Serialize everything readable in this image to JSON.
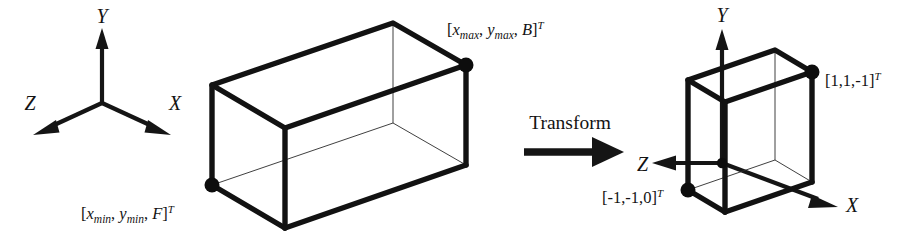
{
  "figure": {
    "colors": {
      "ink": "#121212",
      "thin_edge": "#2a2a2a",
      "background": "#ffffff"
    }
  },
  "left_frame": {
    "name": "world-coordinate-axes",
    "axes": [
      {
        "id": "y",
        "label": "Y",
        "direction": "up"
      },
      {
        "id": "z",
        "label": "Z",
        "direction": "down-left"
      },
      {
        "id": "x",
        "label": "X",
        "direction": "down-right"
      }
    ]
  },
  "left_box": {
    "name": "view-volume-box",
    "labels": {
      "max_corner": {
        "open_bracket": "[",
        "x_base": "x",
        "x_sub": "max",
        "sep1": ", ",
        "y_base": "y",
        "y_sub": "max",
        "sep2": ", ",
        "z_base": "B",
        "close_bracket": "]",
        "transpose": "T",
        "plain": "[xmax, ymax, B]T"
      },
      "min_corner": {
        "open_bracket": "[",
        "x_base": "x",
        "x_sub": "min",
        "sep1": ", ",
        "y_base": "y",
        "y_sub": "min",
        "sep2": ", ",
        "z_base": "F",
        "close_bracket": "]",
        "transpose": "T",
        "plain": "[xmin, ymin, F]T"
      }
    }
  },
  "transform": {
    "name": "transform-arrow",
    "label": "Transform"
  },
  "right_frame": {
    "name": "canonical-coordinate-axes",
    "axes": [
      {
        "id": "y",
        "label": "Y",
        "direction": "up"
      },
      {
        "id": "z",
        "label": "Z",
        "direction": "left"
      },
      {
        "id": "x",
        "label": "X",
        "direction": "down-right"
      }
    ]
  },
  "right_box": {
    "name": "canonical-view-volume-box",
    "labels": {
      "max_corner": {
        "vector": "[1,1,-1]",
        "transpose": "T"
      },
      "min_corner": {
        "vector": "[-1,-1,0]",
        "transpose": "T"
      }
    }
  }
}
